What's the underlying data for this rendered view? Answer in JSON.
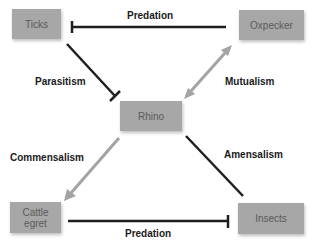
{
  "nodes": {
    "ticks": "Ticks",
    "oxpecker": "Oxpecker",
    "rhino": "Rhino",
    "cattle_egret_line1": "Cattle",
    "cattle_egret_line2": "egret",
    "insects": "Insects"
  },
  "edges": {
    "top": "Predation",
    "parasitism": "Parasitism",
    "mutualism": "Mutualism",
    "commensalism": "Commensalism",
    "amensalism": "Amensalism",
    "bottom": "Predation"
  },
  "colors": {
    "node_fill": "#a7a7a7",
    "node_text": "#5a5a5a",
    "inhibit_line": "#1f1f1f",
    "positive_arrow": "#a3a3a3"
  }
}
